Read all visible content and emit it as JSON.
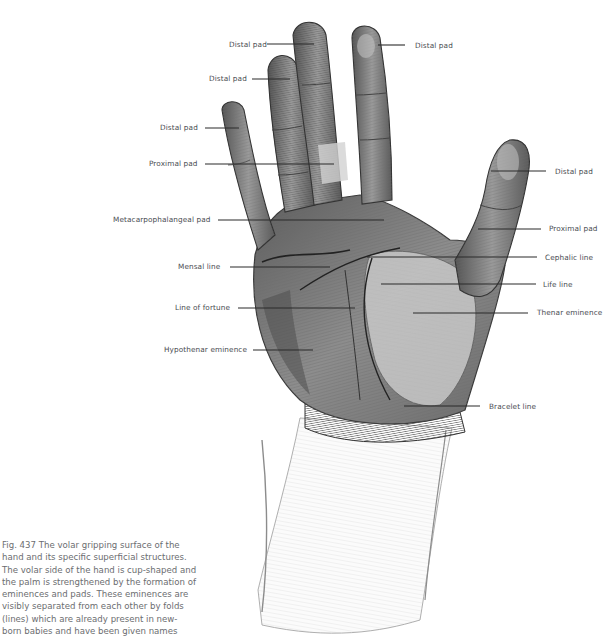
{
  "figure": {
    "number": "Fig. 437",
    "caption_lines": [
      "Fig. 437  The volar gripping surface of the",
      "hand and its specific superficial structures.",
      "The volar side of the hand is cup-shaped and",
      "the palm is strengthened by the formation of",
      "eminences and pads. These eminences are",
      "visibly separated from each other by folds",
      "(lines) which are already present in new-",
      "born babies and have been given names"
    ],
    "caption_text": "Fig. 437 The volar gripping surface of the hand and its specific superficial structures. The volar side of the hand is cup-shaped and the palm is strengthened by the formation of eminences and pads. These eminences are visibly separated from each other by folds (lines) which are already present in new-born babies and have been given names"
  },
  "labels": [
    {
      "id": "distal-pad-middle",
      "text": "Distal pad",
      "side": "left",
      "x": 229,
      "y": 40,
      "line": [
        267,
        44,
        314,
        44
      ]
    },
    {
      "id": "distal-pad-index",
      "text": "Distal pad",
      "side": "right",
      "x": 415,
      "y": 41,
      "line": [
        378,
        45,
        405,
        45
      ]
    },
    {
      "id": "distal-pad-ring",
      "text": "Distal pad",
      "side": "left",
      "x": 209,
      "y": 74,
      "line": [
        252,
        79,
        290,
        79
      ]
    },
    {
      "id": "distal-pad-little",
      "text": "Distal pad",
      "side": "left",
      "x": 160,
      "y": 123,
      "line": [
        205,
        128,
        239,
        128
      ]
    },
    {
      "id": "proximal-pad-finger",
      "text": "Proximal pad",
      "side": "left",
      "x": 149,
      "y": 159,
      "line": [
        205,
        164,
        334,
        164
      ]
    },
    {
      "id": "distal-pad-thumb",
      "text": "Distal pad",
      "side": "right",
      "x": 555,
      "y": 167,
      "line": [
        491,
        171,
        546,
        171
      ]
    },
    {
      "id": "metacarpophalangeal-pad",
      "text": "Metacarpophalangeal pad",
      "side": "left",
      "x": 113,
      "y": 215,
      "line": [
        218,
        220,
        384,
        220
      ]
    },
    {
      "id": "proximal-pad-thumb",
      "text": "Proximal pad",
      "side": "right",
      "x": 549,
      "y": 224,
      "line": [
        478,
        229,
        541,
        229
      ]
    },
    {
      "id": "cephalic-line",
      "text": "Cephalic line",
      "side": "right",
      "x": 545,
      "y": 253,
      "line": [
        367,
        257,
        537,
        257
      ]
    },
    {
      "id": "mensal-line",
      "text": "Mensal line",
      "side": "left",
      "x": 178,
      "y": 262,
      "line": [
        230,
        267,
        330,
        267
      ]
    },
    {
      "id": "life-line",
      "text": "Life line",
      "side": "right",
      "x": 543,
      "y": 280,
      "line": [
        381,
        284,
        536,
        284
      ]
    },
    {
      "id": "line-of-fortune",
      "text": "Line of fortune",
      "side": "left",
      "x": 175,
      "y": 303,
      "line": [
        238,
        308,
        355,
        308
      ]
    },
    {
      "id": "thenar-eminence",
      "text": "Thenar eminence",
      "side": "right",
      "x": 537,
      "y": 308,
      "line": [
        413,
        313,
        528,
        313
      ]
    },
    {
      "id": "hypothenar-eminence",
      "text": "Hypothenar eminence",
      "side": "left",
      "x": 164,
      "y": 345,
      "line": [
        253,
        350,
        313,
        350
      ]
    },
    {
      "id": "bracelet-line",
      "text": "Bracelet line",
      "side": "right",
      "x": 489,
      "y": 402,
      "line": [
        404,
        406,
        480,
        406
      ]
    }
  ],
  "colors": {
    "background": "#ffffff",
    "label_text": "#4a4d52",
    "caption_text": "#6b6d70",
    "leader_line": "#2b2b2b",
    "sketch_dark": "#3a3a3a",
    "sketch_mid": "#8a8a8a",
    "sketch_light": "#c9c9c9"
  }
}
